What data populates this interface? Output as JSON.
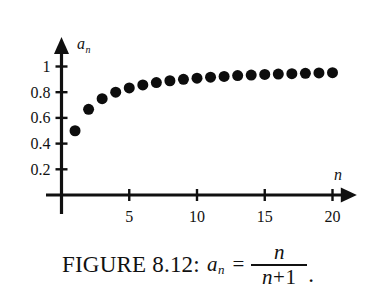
{
  "figure": {
    "caption_label": "FIGURE 8.12:",
    "caption_variable": "a",
    "caption_variable_sub": "n",
    "caption_equals": "=",
    "caption_numerator": "n",
    "caption_denominator_var": "n",
    "caption_denominator_op": "+",
    "caption_denominator_const": "1",
    "caption_period": ".",
    "background_color": "#ffffff",
    "ink_color": "#111111"
  },
  "chart_data": {
    "type": "scatter",
    "title": "",
    "xlabel": "n",
    "ylabel": "a_n",
    "xlim": [
      0,
      21.5
    ],
    "ylim": [
      0,
      1.12
    ],
    "grid": false,
    "legend": "none",
    "xticks": [
      5,
      10,
      15,
      20
    ],
    "xticklabels": [
      "5",
      "10",
      "15",
      "20"
    ],
    "yticks": [
      0.2,
      0.4,
      0.6,
      0.8,
      1
    ],
    "yticklabels": [
      "0.2",
      "0.4",
      "0.6",
      "0.8",
      "1"
    ],
    "marker": "filled-circle",
    "marker_color": "#0d0d0d",
    "marker_size_px": 11,
    "x": [
      1,
      2,
      3,
      4,
      5,
      6,
      7,
      8,
      9,
      10,
      11,
      12,
      13,
      14,
      15,
      16,
      17,
      18,
      19,
      20
    ],
    "y": [
      0.5,
      0.667,
      0.75,
      0.8,
      0.833,
      0.857,
      0.875,
      0.889,
      0.9,
      0.909,
      0.917,
      0.923,
      0.929,
      0.933,
      0.938,
      0.941,
      0.944,
      0.947,
      0.95,
      0.952
    ],
    "annotations": []
  }
}
